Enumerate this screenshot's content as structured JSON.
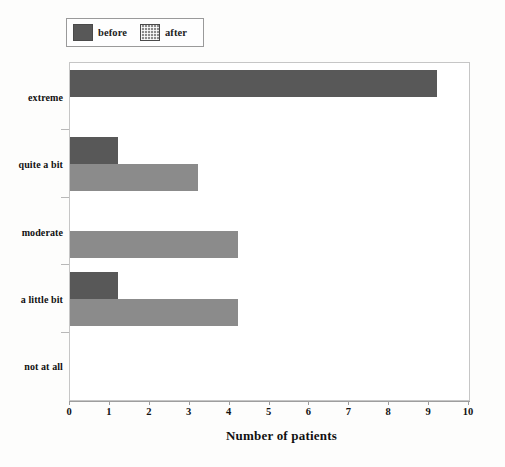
{
  "chart_data": {
    "type": "bar",
    "orientation": "horizontal",
    "title": "",
    "subtitle": "",
    "xlabel": "Number of patients",
    "ylabel": "",
    "categories": [
      "not at all",
      "a little bit",
      "moderate",
      "quite a bit",
      "extreme"
    ],
    "series": [
      {
        "name": "before",
        "color": "#585858",
        "values": [
          0,
          1.2,
          0,
          1.2,
          9.2
        ]
      },
      {
        "name": "after",
        "color": "#8b8b8b",
        "values": [
          0,
          4.2,
          4.2,
          3.2,
          0
        ]
      }
    ],
    "xlim": [
      0,
      10
    ],
    "xticks": [
      0,
      1,
      2,
      3,
      4,
      5,
      6,
      7,
      8,
      9,
      10
    ],
    "xtick_labels": [
      "0",
      "1",
      "2",
      "3",
      "4",
      "5",
      "6",
      "7",
      "8",
      "9",
      "10"
    ],
    "grid": false,
    "legend_position": "above-left",
    "annotations": []
  },
  "legend": {
    "entries": [
      {
        "label": "before",
        "swatch": "solid-dark-gray-swatch",
        "color": "#585858"
      },
      {
        "label": "after",
        "swatch": "dotted-gray-swatch",
        "color": "#8b8b8b"
      }
    ]
  },
  "axis": {
    "x_title": "Number of patients"
  }
}
